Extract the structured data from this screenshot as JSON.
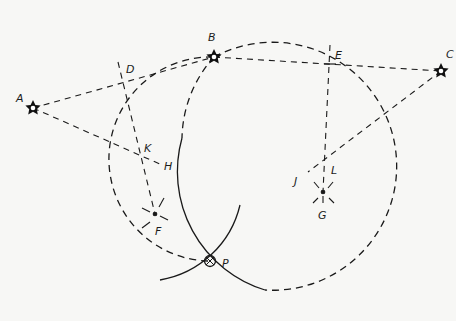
{
  "diagram": {
    "points": {
      "A": {
        "label": "A",
        "kind": "star"
      },
      "B": {
        "label": "B",
        "kind": "star"
      },
      "C": {
        "label": "C",
        "kind": "star"
      },
      "D": {
        "label": "D",
        "kind": "midpoint"
      },
      "E": {
        "label": "E",
        "kind": "midpoint"
      },
      "F": {
        "label": "F",
        "kind": "center"
      },
      "G": {
        "label": "G",
        "kind": "center"
      },
      "H": {
        "label": "H",
        "kind": "point"
      },
      "J": {
        "label": "J",
        "kind": "point"
      },
      "K": {
        "label": "K",
        "kind": "point"
      },
      "L": {
        "label": "L",
        "kind": "point"
      },
      "P": {
        "label": "P",
        "kind": "intersection"
      }
    },
    "ink_color": "#1a1a1a",
    "paper_color": "#f7f7f5"
  }
}
